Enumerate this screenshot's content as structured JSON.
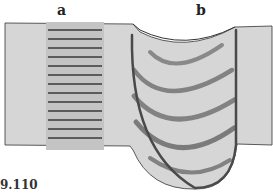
{
  "figure": {
    "labels": {
      "a": "a",
      "b": "b"
    },
    "caption": "9.110",
    "colors": {
      "background": "#ffffff",
      "slab": "#d6d6d6",
      "bands": "#4a4a4a",
      "outline": "#333333"
    },
    "panels": [
      {
        "id": "a",
        "description": "vertical column with horizontal striations",
        "stripe_count": 13
      },
      {
        "id": "b",
        "description": "U-shaped pool with nested curved layer bands",
        "band_count": 5
      }
    ]
  }
}
